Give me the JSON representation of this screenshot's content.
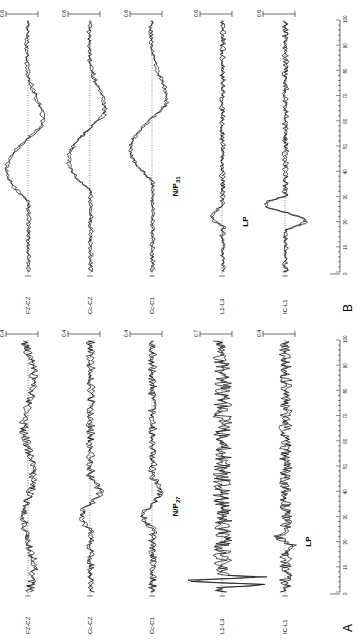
{
  "figure": {
    "orientation": "rotated-90-ccw",
    "panels": [
      {
        "id": "B",
        "label": "B",
        "channels": [
          {
            "name": "FZ-CZ",
            "scale": "0.6",
            "shape": "large-wave",
            "phase": 0
          },
          {
            "name": "Cc-CZ",
            "scale": "0.6",
            "shape": "large-wave",
            "phase": 1
          },
          {
            "name": "Cc-C1",
            "scale": "0.6",
            "shape": "large-wave",
            "phase": 2
          },
          {
            "name": "L1-L3",
            "scale": "0.6",
            "shape": "lp-small"
          },
          {
            "name": "IC-L1",
            "scale": "0.6",
            "shape": "lp-large"
          }
        ],
        "annotations": [
          {
            "text": "N/P",
            "sub": "31",
            "channel": 2
          },
          {
            "text": "LP",
            "sub": "",
            "channel": 3
          }
        ],
        "x_axis": {
          "ticks": [
            "0",
            "10",
            "20",
            "30",
            "40",
            "50",
            "60",
            "70",
            "80",
            "90",
            "100"
          ],
          "unit_marker": "ms"
        }
      },
      {
        "id": "A",
        "label": "A",
        "channels": [
          {
            "name": "FZ-CZ",
            "scale": "0.4",
            "shape": "noisy-small"
          },
          {
            "name": "Cc-CZ",
            "scale": "0.4",
            "shape": "noisy-dip"
          },
          {
            "name": "Cc-C1",
            "scale": "0.4",
            "shape": "noisy-dip"
          },
          {
            "name": "L1-L3",
            "scale": "0.7",
            "shape": "artifact-noisy"
          },
          {
            "name": "IC-L1",
            "scale": "0.4",
            "shape": "noisy-lp"
          }
        ],
        "annotations": [
          {
            "text": "N/P",
            "sub": "27",
            "channel": 2
          },
          {
            "text": "LP",
            "sub": "",
            "channel": 4
          }
        ],
        "x_axis": {
          "ticks": [
            "0",
            "10",
            "20",
            "30",
            "40",
            "50",
            "60",
            "70",
            "80",
            "90",
            "100"
          ],
          "unit_marker": "ms"
        }
      }
    ]
  },
  "chart_data": [
    {
      "type": "line",
      "title": "Panel B — evoked potentials (two superimposed trials)",
      "xlabel": "Time (ms)",
      "ylabel": "Amplitude",
      "xlim": [
        0,
        100
      ],
      "x_ticks": [
        0,
        10,
        20,
        30,
        40,
        50,
        60,
        70,
        80,
        90,
        100
      ],
      "series": [
        {
          "name": "FZ-CZ",
          "scale": 0.6,
          "description": "large biphasic waves peaking near 44 ms and 62 ms"
        },
        {
          "name": "Cc-CZ",
          "scale": 0.6,
          "description": "large waves, peaks near 40, 55 and 70 ms"
        },
        {
          "name": "Cc-C1",
          "scale": 0.6,
          "description": "N/P31 onset then large waves near 45 and 60 ms"
        },
        {
          "name": "L1-L3",
          "scale": 0.6,
          "description": "small noisy trace with LP deflection near 22 ms"
        },
        {
          "name": "IC-L1",
          "scale": 0.6,
          "description": "noisy trace with large LP deflection near 22-26 ms"
        }
      ],
      "annotations": [
        "N/P31",
        "LP"
      ],
      "grid": false,
      "legend": "channel labels at left of each trace"
    },
    {
      "type": "line",
      "title": "Panel A — evoked potentials (two superimposed trials)",
      "xlabel": "Time (ms)",
      "ylabel": "Amplitude",
      "xlim": [
        0,
        100
      ],
      "x_ticks": [
        0,
        10,
        20,
        30,
        40,
        50,
        60,
        70,
        80,
        90,
        100
      ],
      "series": [
        {
          "name": "FZ-CZ",
          "scale": 0.4,
          "description": "low amplitude noisy trace"
        },
        {
          "name": "Cc-CZ",
          "scale": 0.4,
          "description": "noisy trace with small waves near 30-45 ms"
        },
        {
          "name": "Cc-C1",
          "scale": 0.4,
          "description": "noisy trace with N/P27 near 27 ms"
        },
        {
          "name": "L1-L3",
          "scale": 0.7,
          "description": "stimulus artifact at ~3 ms then high-frequency noise"
        },
        {
          "name": "IC-L1",
          "scale": 0.4,
          "description": "noisy trace with LP near 20 ms"
        }
      ],
      "annotations": [
        "N/P27",
        "LP"
      ],
      "grid": false,
      "legend": "channel labels at left of each trace"
    }
  ]
}
